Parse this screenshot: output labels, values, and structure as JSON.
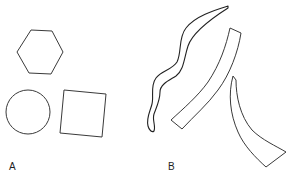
{
  "figure": {
    "background": "#ffffff",
    "stroke_color": "#3a3a3a",
    "panels": [
      {
        "label": "A",
        "shapes": [
          {
            "name": "hexagon",
            "type": "regular-polygon"
          },
          {
            "name": "circle",
            "type": "circle"
          },
          {
            "name": "square",
            "type": "rotated-square"
          }
        ]
      },
      {
        "label": "B",
        "shapes": [
          {
            "name": "wavy-strip",
            "type": "irregular-curved-outline"
          },
          {
            "name": "straight-strip",
            "type": "irregular-curved-outline"
          },
          {
            "name": "horn-strip",
            "type": "irregular-curved-outline"
          }
        ]
      }
    ]
  }
}
